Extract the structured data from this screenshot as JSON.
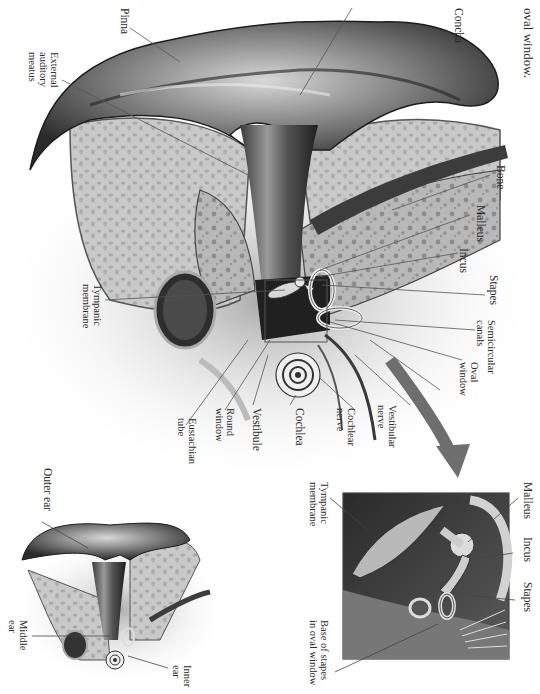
{
  "page": {
    "orientation": "rotated 90 degrees clockwise",
    "caption_fragment": "oval window."
  },
  "main_diagram": {
    "labels": [
      {
        "id": "pinna",
        "text": "Pinna"
      },
      {
        "id": "external-auditory-meatus",
        "text": "External\nauditory\nmeatus"
      },
      {
        "id": "concha",
        "text": "Concha"
      },
      {
        "id": "bone",
        "text": "Bone"
      },
      {
        "id": "malleus",
        "text": "Malleus"
      },
      {
        "id": "incus",
        "text": "Incus"
      },
      {
        "id": "stapes",
        "text": "Stapes"
      },
      {
        "id": "semicircular-canals",
        "text": "Semicircular\ncanals"
      },
      {
        "id": "oval-window",
        "text": "Oval\nwindow"
      },
      {
        "id": "vestibular-nerve",
        "text": "Vestibular\nnerve"
      },
      {
        "id": "cochlear-nerve",
        "text": "Cochlear\nnerve"
      },
      {
        "id": "cochlea",
        "text": "Cochlea"
      },
      {
        "id": "vestibule",
        "text": "Vestibule"
      },
      {
        "id": "round-window",
        "text": "Round\nwindow"
      },
      {
        "id": "eustachian-tube",
        "text": "Eustachian\ntube"
      },
      {
        "id": "tympanic-membrane",
        "text": "Tympanic\nmembrane"
      }
    ]
  },
  "inset_detail": {
    "labels": [
      {
        "id": "malleus",
        "text": "Malleus"
      },
      {
        "id": "incus",
        "text": "Incus"
      },
      {
        "id": "stapes",
        "text": "Stapes"
      },
      {
        "id": "tympanic-membrane",
        "text": "Tympanic\nmembrane"
      },
      {
        "id": "base-of-stapes",
        "text": "Base of stapes\nin oval window"
      }
    ]
  },
  "overview_diagram": {
    "labels": [
      {
        "id": "outer-ear",
        "text": "Outer ear"
      },
      {
        "id": "middle-ear",
        "text": "Middle\near"
      },
      {
        "id": "inner-ear",
        "text": "Inner\near"
      }
    ]
  },
  "colors": {
    "background": "#ffffff",
    "skin_dark": "#2b2b2b",
    "skin_mid": "#8a8a8a",
    "bone": "#b9b9b9",
    "arrow": "#6e6e6e",
    "leader_line": "#555555"
  }
}
